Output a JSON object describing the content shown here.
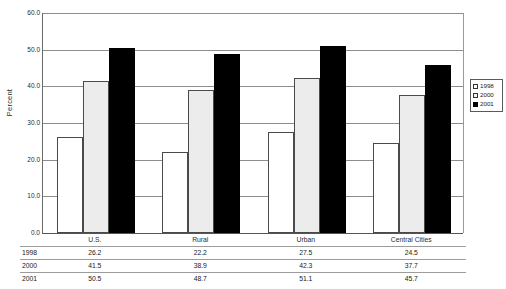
{
  "chart_data": {
    "type": "bar",
    "title": "",
    "subtitle": "",
    "xlabel": "",
    "ylabel": "Percent",
    "ylim": [
      0.0,
      60.0
    ],
    "ytick_step": 10.0,
    "ytick_labels": [
      "60.0",
      "50.0",
      "40.0",
      "30.0",
      "20.0",
      "10.0",
      "0.0"
    ],
    "ytick_values": [
      60.0,
      50.0,
      40.0,
      30.0,
      20.0,
      10.0,
      0.0
    ],
    "grid": true,
    "grid_axis": "y",
    "legend_position": "right",
    "categories": [
      "U.S.",
      "Rural",
      "Urban",
      "Central Cities"
    ],
    "series": [
      {
        "name": "1998",
        "color": "#ffffff",
        "values": [
          26.2,
          22.2,
          27.5,
          24.5
        ]
      },
      {
        "name": "2000",
        "color": "#ececec",
        "values": [
          41.5,
          38.9,
          42.3,
          37.7
        ]
      },
      {
        "name": "2001",
        "color": "#000000",
        "values": [
          50.5,
          48.7,
          51.1,
          45.7
        ]
      }
    ],
    "data_table": {
      "row_labels": [
        "1998",
        "2000",
        "2001"
      ],
      "column_labels": [
        "U.S.",
        "Rural",
        "Urban",
        "Central Cities"
      ],
      "rows": [
        [
          "26.2",
          "22.2",
          "27.5",
          "24.5"
        ],
        [
          "41.5",
          "38.9",
          "42.3",
          "37.7"
        ],
        [
          "50.5",
          "48.7",
          "51.1",
          "45.7"
        ]
      ]
    }
  }
}
